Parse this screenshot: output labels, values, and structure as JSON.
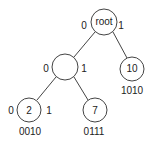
{
  "diagram": {
    "type": "binary-trie",
    "nodes": [
      {
        "id": "root",
        "label": "root",
        "cx": 104,
        "cy": 22,
        "r": 13,
        "code": ""
      },
      {
        "id": "n0",
        "label": "",
        "cx": 65,
        "cy": 67,
        "r": 13,
        "code": ""
      },
      {
        "id": "n10",
        "label": "10",
        "cx": 132,
        "cy": 69,
        "r": 12,
        "code": "1010"
      },
      {
        "id": "n2",
        "label": "2",
        "cx": 29,
        "cy": 110,
        "r": 12,
        "code": "0010"
      },
      {
        "id": "n7",
        "label": "7",
        "cx": 95,
        "cy": 110,
        "r": 12,
        "code": "0111"
      }
    ],
    "edges": [
      {
        "from": "root",
        "to": "n0",
        "bit": "0"
      },
      {
        "from": "root",
        "to": "n10",
        "bit": "1"
      },
      {
        "from": "n0",
        "to": "n2",
        "bit": "0"
      },
      {
        "from": "n0",
        "to": "n7",
        "bit": "1"
      }
    ],
    "bit_labels": {
      "root_left": "0",
      "root_right": "1",
      "mid_left": "0",
      "mid_right": "1",
      "n2_left": "0",
      "n2_right": "1"
    },
    "node_labels": {
      "root": "root",
      "n10": "10",
      "n2": "2",
      "n7": "7"
    },
    "codes": {
      "n10": "1010",
      "n2": "0010",
      "n7": "0111"
    }
  }
}
